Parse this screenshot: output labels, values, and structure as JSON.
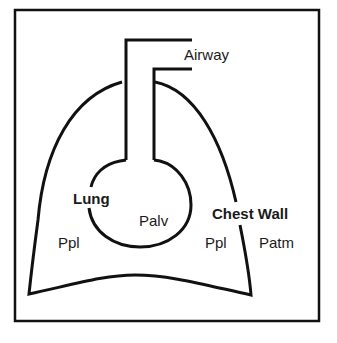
{
  "diagram": {
    "labels": {
      "airway": "Airway",
      "lung": "Lung",
      "palv": "Palv",
      "chest_wall": "Chest Wall",
      "ppl_left": "Ppl",
      "ppl_right": "Ppl",
      "patm": "Patm"
    },
    "colors": {
      "stroke": "#111111",
      "text": "#1a1a1a",
      "background": "#ffffff"
    }
  }
}
